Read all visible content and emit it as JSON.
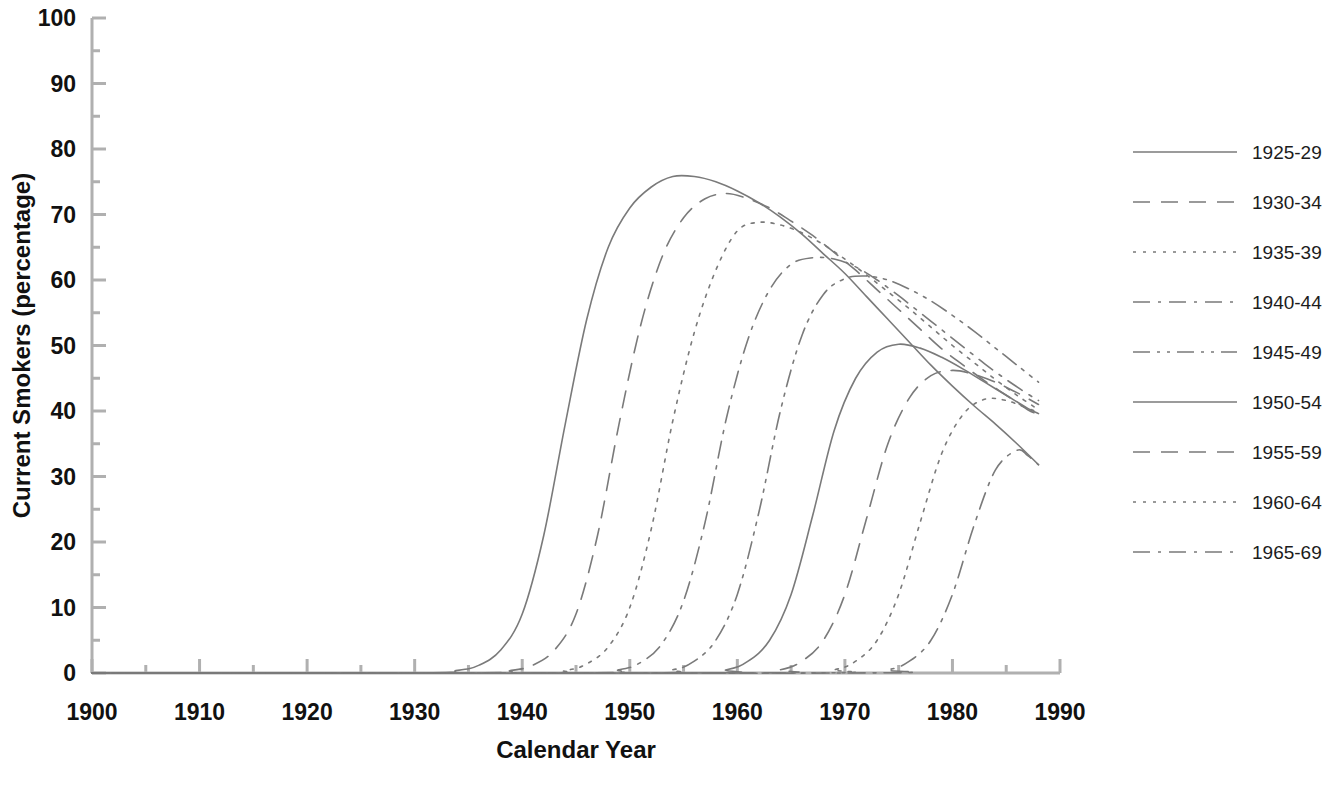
{
  "chart_data": {
    "type": "line",
    "title": "",
    "xlabel": "Calendar Year",
    "ylabel": "Current Smokers (percentage)",
    "xlim": [
      1900,
      1990
    ],
    "ylim": [
      0,
      100
    ],
    "xticks": [
      1900,
      1910,
      1920,
      1930,
      1940,
      1950,
      1960,
      1970,
      1980,
      1990
    ],
    "yticks": [
      0,
      10,
      20,
      30,
      40,
      50,
      60,
      70,
      80,
      90,
      100
    ],
    "xminor_step": 5,
    "yminor_step": 5,
    "grid": false,
    "legend_position": "right",
    "line_color": "#7a7a7a",
    "axis_color": "#b0b0b0",
    "series": [
      {
        "name": "1925-29",
        "style": "solid",
        "x": [
          1900,
          1930,
          1934,
          1936,
          1938,
          1940,
          1942,
          1944,
          1946,
          1948,
          1950,
          1952,
          1954,
          1956,
          1958,
          1960,
          1962,
          1964,
          1966,
          1968,
          1970,
          1972,
          1974,
          1976,
          1978,
          1980,
          1982,
          1984,
          1986,
          1988
        ],
        "y": [
          0,
          0,
          0.4,
          1.2,
          3.5,
          9.0,
          21.0,
          38.0,
          54.0,
          65.0,
          71.0,
          74.2,
          75.8,
          75.8,
          75.0,
          73.6,
          71.8,
          69.6,
          67.0,
          64.0,
          61.0,
          57.5,
          54.0,
          50.5,
          47.0,
          43.8,
          40.8,
          38.0,
          35.0,
          31.8
        ]
      },
      {
        "name": "1930-34",
        "style": "dashed",
        "x": [
          1900,
          1935,
          1939,
          1941,
          1943,
          1945,
          1947,
          1949,
          1951,
          1953,
          1955,
          1957,
          1959,
          1961,
          1963,
          1965,
          1967,
          1969,
          1971,
          1973,
          1975,
          1977,
          1979,
          1981,
          1983,
          1985,
          1987,
          1988
        ],
        "y": [
          0,
          0,
          0.4,
          1.2,
          3.5,
          9.0,
          21.0,
          38.0,
          53.0,
          63.5,
          69.5,
          72.4,
          73.2,
          72.4,
          71.0,
          69.0,
          66.8,
          64.2,
          61.5,
          58.5,
          55.5,
          52.5,
          49.5,
          47.0,
          44.6,
          42.4,
          40.2,
          39.5
        ]
      },
      {
        "name": "1935-39",
        "style": "dotted",
        "x": [
          1900,
          1940,
          1944,
          1946,
          1948,
          1950,
          1952,
          1954,
          1956,
          1958,
          1960,
          1962,
          1964,
          1966,
          1968,
          1970,
          1972,
          1974,
          1976,
          1978,
          1980,
          1982,
          1984,
          1986,
          1988
        ],
        "y": [
          0,
          0,
          0.4,
          1.4,
          4.0,
          10.0,
          22.0,
          38.5,
          52.0,
          61.5,
          67.5,
          68.8,
          68.4,
          67.2,
          65.4,
          63.2,
          60.8,
          58.2,
          55.6,
          52.8,
          50.0,
          47.4,
          44.8,
          42.4,
          40.2
        ]
      },
      {
        "name": "1940-44",
        "style": "dashdot",
        "x": [
          1900,
          1945,
          1949,
          1951,
          1953,
          1955,
          1957,
          1959,
          1961,
          1963,
          1965,
          1967,
          1969,
          1971,
          1973,
          1975,
          1977,
          1979,
          1981,
          1983,
          1985,
          1987,
          1988
        ],
        "y": [
          0,
          0,
          0.5,
          1.6,
          4.5,
          11.0,
          23.0,
          39.0,
          51.0,
          58.5,
          62.4,
          63.4,
          63.2,
          62.0,
          60.0,
          57.6,
          55.0,
          52.4,
          49.8,
          47.2,
          44.8,
          42.6,
          41.6
        ]
      },
      {
        "name": "1945-49",
        "style": "dashdotdot",
        "x": [
          1900,
          1950,
          1954,
          1956,
          1958,
          1960,
          1962,
          1964,
          1966,
          1968,
          1970,
          1972,
          1974,
          1976,
          1978,
          1980,
          1982,
          1984,
          1986,
          1988
        ],
        "y": [
          0,
          0,
          0.5,
          1.8,
          5.0,
          12.0,
          24.5,
          40.0,
          51.5,
          57.8,
          60.2,
          60.6,
          60.0,
          58.6,
          56.8,
          54.6,
          52.2,
          49.6,
          47.0,
          44.4
        ]
      },
      {
        "name": "1950-54",
        "style": "solid",
        "x": [
          1900,
          1955,
          1959,
          1961,
          1963,
          1965,
          1967,
          1969,
          1971,
          1973,
          1975,
          1977,
          1979,
          1981,
          1983,
          1985,
          1987,
          1988
        ],
        "y": [
          0,
          0,
          0.5,
          1.8,
          5.0,
          12.0,
          24.0,
          37.0,
          45.0,
          49.0,
          50.2,
          49.6,
          48.2,
          46.4,
          44.4,
          42.4,
          40.4,
          39.6
        ]
      },
      {
        "name": "1955-59",
        "style": "dashed",
        "x": [
          1900,
          1960,
          1964,
          1966,
          1968,
          1970,
          1972,
          1974,
          1976,
          1978,
          1980,
          1982,
          1984,
          1986,
          1988
        ],
        "y": [
          0,
          0,
          0.5,
          1.8,
          5.0,
          12.0,
          23.5,
          35.0,
          42.0,
          45.4,
          46.2,
          45.6,
          44.4,
          42.8,
          41.0
        ]
      },
      {
        "name": "1960-64",
        "style": "dotted",
        "x": [
          1900,
          1965,
          1969,
          1971,
          1973,
          1975,
          1977,
          1979,
          1981,
          1983,
          1985,
          1987,
          1988
        ],
        "y": [
          0,
          0,
          0.5,
          1.8,
          5.0,
          12.0,
          23.0,
          33.5,
          39.5,
          41.8,
          41.6,
          40.4,
          39.8
        ]
      },
      {
        "name": "1965-69",
        "style": "dashdot",
        "x": [
          1900,
          1970,
          1974,
          1976,
          1978,
          1980,
          1982,
          1984,
          1986,
          1987,
          1988
        ],
        "y": [
          0,
          0,
          0.5,
          1.8,
          5.0,
          12.0,
          22.5,
          31.0,
          34.0,
          33.2,
          31.8
        ]
      }
    ]
  },
  "legend": {
    "items": [
      {
        "label": "1925-29",
        "style": "solid"
      },
      {
        "label": "1930-34",
        "style": "dashed"
      },
      {
        "label": "1935-39",
        "style": "dotted"
      },
      {
        "label": "1940-44",
        "style": "dashdot"
      },
      {
        "label": "1945-49",
        "style": "dashdotdot"
      },
      {
        "label": "1950-54",
        "style": "solid"
      },
      {
        "label": "1955-59",
        "style": "dashed"
      },
      {
        "label": "1960-64",
        "style": "dotted"
      },
      {
        "label": "1965-69",
        "style": "dashdot"
      }
    ]
  }
}
